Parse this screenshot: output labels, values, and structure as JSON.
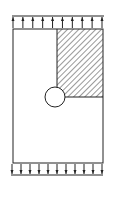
{
  "diagram": {
    "type": "plate-with-hole-under-tension",
    "colors": {
      "stroke": "#222222",
      "background": "#ffffff",
      "hatch": "#333333"
    },
    "plate": {
      "x": 13,
      "y": 29,
      "width": 90,
      "height": 134
    },
    "hole": {
      "cx": 55,
      "cy": 97,
      "r": 10
    },
    "hatched_region": {
      "x": 57,
      "y": 29,
      "width": 46,
      "height": 68
    },
    "top_load": {
      "line_y": 16,
      "arrow_count": 10,
      "direction": "up"
    },
    "bottom_load": {
      "line_y": 175,
      "arrow_count": 11,
      "direction": "down"
    }
  }
}
